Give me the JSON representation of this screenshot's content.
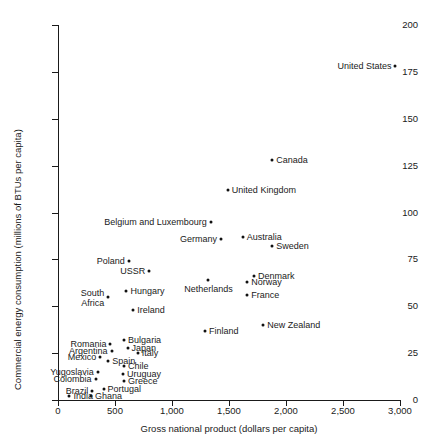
{
  "chart_data": {
    "type": "scatter",
    "title": "",
    "xlabel": "Gross national product (dollars per capita)",
    "ylabel": "Commercial energy consumption (millions of BTUs per capita)",
    "xlim": [
      0,
      3000
    ],
    "ylim": [
      0,
      200
    ],
    "xticks": [
      0,
      500,
      1000,
      1500,
      2000,
      2500,
      3000
    ],
    "xticklabels": [
      "0",
      "500",
      "1,000",
      "1,500",
      "2,000",
      "2,500",
      "3,000"
    ],
    "yticks": [
      0,
      25,
      50,
      75,
      100,
      125,
      150,
      175,
      200
    ],
    "yticklabels": [
      "0",
      "25",
      "50",
      "75",
      "100",
      "125",
      "150",
      "175",
      "200"
    ],
    "grid": false,
    "legend": null,
    "marker_color": "#111111",
    "points": [
      {
        "label": "United States",
        "x": 2960,
        "y": 178,
        "pos": "l"
      },
      {
        "label": "Canada",
        "x": 1880,
        "y": 128,
        "pos": "r"
      },
      {
        "label": "United Kingdom",
        "x": 1490,
        "y": 112,
        "pos": "r"
      },
      {
        "label": "Belgium and Luxembourg",
        "x": 1340,
        "y": 95,
        "pos": "l"
      },
      {
        "label": "Germany",
        "x": 1430,
        "y": 86,
        "pos": "l"
      },
      {
        "label": "Australia",
        "x": 1620,
        "y": 87,
        "pos": "r"
      },
      {
        "label": "Sweden",
        "x": 1880,
        "y": 82,
        "pos": "r"
      },
      {
        "label": "Poland",
        "x": 620,
        "y": 74,
        "pos": "l"
      },
      {
        "label": "USSR",
        "x": 800,
        "y": 69,
        "pos": "l"
      },
      {
        "label": "Denmark",
        "x": 1720,
        "y": 66,
        "pos": "r"
      },
      {
        "label": "Norway",
        "x": 1660,
        "y": 63,
        "pos": "r"
      },
      {
        "label": "Netherlands",
        "x": 1320,
        "y": 64,
        "pos": "b"
      },
      {
        "label": "Hungary",
        "x": 600,
        "y": 58,
        "pos": "r"
      },
      {
        "label": "South\nAfrica",
        "x": 440,
        "y": 55,
        "pos": "l2"
      },
      {
        "label": "Ireland",
        "x": 660,
        "y": 48,
        "pos": "r"
      },
      {
        "label": "France",
        "x": 1660,
        "y": 56,
        "pos": "r"
      },
      {
        "label": "New Zealand",
        "x": 1800,
        "y": 40,
        "pos": "r"
      },
      {
        "label": "Finland",
        "x": 1290,
        "y": 37,
        "pos": "r"
      },
      {
        "label": "Bulgaria",
        "x": 580,
        "y": 32,
        "pos": "r"
      },
      {
        "label": "Romania",
        "x": 460,
        "y": 30,
        "pos": "l"
      },
      {
        "label": "Japan",
        "x": 610,
        "y": 28,
        "pos": "r"
      },
      {
        "label": "Argentina",
        "x": 470,
        "y": 26,
        "pos": "l"
      },
      {
        "label": "Italy",
        "x": 700,
        "y": 25,
        "pos": "r"
      },
      {
        "label": "Mexico",
        "x": 370,
        "y": 23,
        "pos": "l"
      },
      {
        "label": "Spain",
        "x": 440,
        "y": 21,
        "pos": "r"
      },
      {
        "label": "Chile",
        "x": 580,
        "y": 18,
        "pos": "r"
      },
      {
        "label": "Yugoslavia",
        "x": 350,
        "y": 15,
        "pos": "l"
      },
      {
        "label": "Uruguay",
        "x": 570,
        "y": 14,
        "pos": "r"
      },
      {
        "label": "Colombia",
        "x": 330,
        "y": 11,
        "pos": "l"
      },
      {
        "label": "Greece",
        "x": 580,
        "y": 10,
        "pos": "r"
      },
      {
        "label": "Portugal",
        "x": 400,
        "y": 6,
        "pos": "r"
      },
      {
        "label": "Brazil",
        "x": 300,
        "y": 5,
        "pos": "l"
      },
      {
        "label": "Ghana",
        "x": 290,
        "y": 2,
        "pos": "r"
      },
      {
        "label": "India",
        "x": 100,
        "y": 2,
        "pos": "r"
      }
    ]
  }
}
